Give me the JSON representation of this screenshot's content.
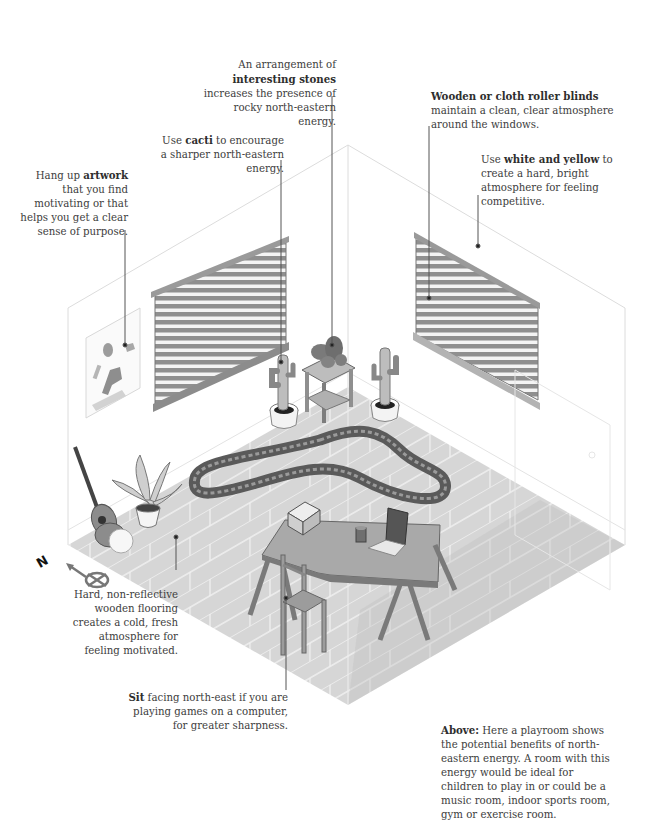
{
  "annotations": {
    "stones": {
      "pre": "An arrangement of ",
      "bold": "interesting stones",
      "post": " increases the presence of rocky north-eastern energy."
    },
    "blinds": {
      "bold": "Wooden or cloth roller blinds",
      "post": " maintain a clean, clear atmosphere around the windows."
    },
    "cacti": {
      "pre": "Use ",
      "bold": "cacti",
      "post": " to encourage a sharper north-eastern energy."
    },
    "colors": {
      "pre": "Use ",
      "bold": "white and yellow",
      "post": " to create a hard, bright atmosphere for feeling competitive."
    },
    "artwork": {
      "pre": "Hang up ",
      "bold": "artwork",
      "post": " that you find motivating or that helps you get a clear sense of purpose."
    },
    "flooring": {
      "text": "Hard, non-reflective wooden flooring creates a cold, fresh atmosphere for feeling motivated."
    },
    "sit": {
      "bold": "Sit",
      "post": " facing north-east if you are playing games on a computer, for greater sharpness."
    }
  },
  "caption": {
    "bold": "Above:",
    "text": " Here a playroom shows the potential benefits of north-eastern energy. A room with this energy would be ideal for children to play in or could be a music room, indoor sports room, gym or exercise room."
  },
  "compass": {
    "label": "N",
    "icon": "compass-icon"
  },
  "colors": {
    "text": "#3d3d3d",
    "leader_line": "#555555",
    "floor": "#d8d8d8",
    "wall_line": "#dddddd",
    "blind": "#8a8a8a"
  }
}
